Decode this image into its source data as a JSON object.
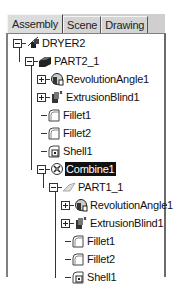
{
  "tabs": [
    {
      "label": "Assembly",
      "active": true
    },
    {
      "label": "Scene",
      "active": false
    },
    {
      "label": "Drawing",
      "active": false
    }
  ],
  "tree": [
    {
      "label": "DRYER2",
      "level": 0,
      "expander": "minus",
      "icon": "assembly-icon"
    },
    {
      "label": "PART2_1",
      "level": 1,
      "expander": "minus",
      "icon": "part-icon"
    },
    {
      "label": "RevolutionAngle1",
      "level": 2,
      "expander": "plus",
      "icon": "revolution-feature-icon"
    },
    {
      "label": "ExtrusionBlind1",
      "level": 2,
      "expander": "plus",
      "icon": "extrusion-feature-icon"
    },
    {
      "label": "Fillet1",
      "level": 2,
      "expander": "none",
      "icon": "fillet-icon"
    },
    {
      "label": "Fillet2",
      "level": 2,
      "expander": "none",
      "icon": "fillet-icon"
    },
    {
      "label": "Shell1",
      "level": 2,
      "expander": "none",
      "icon": "shell-icon"
    },
    {
      "label": "Combine1",
      "level": 2,
      "expander": "minus",
      "icon": "combine-icon",
      "selected": true
    },
    {
      "label": "PART1_1",
      "level": 3,
      "expander": "minus",
      "icon": "part-ghost-icon"
    },
    {
      "label": "RevolutionAngle1",
      "level": 4,
      "expander": "plus",
      "icon": "revolution-feature-icon"
    },
    {
      "label": "ExtrusionBlind1",
      "level": 4,
      "expander": "plus",
      "icon": "extrusion-feature-icon"
    },
    {
      "label": "Fillet1",
      "level": 4,
      "expander": "none",
      "icon": "fillet-icon"
    },
    {
      "label": "Fillet2",
      "level": 4,
      "expander": "none",
      "icon": "fillet-icon"
    },
    {
      "label": "Shell1",
      "level": 4,
      "expander": "none",
      "icon": "shell-icon"
    }
  ],
  "colors": {
    "selection_bg": "#111111",
    "selection_fg": "#ffffff",
    "tab_bg": "#d4d4d4"
  }
}
